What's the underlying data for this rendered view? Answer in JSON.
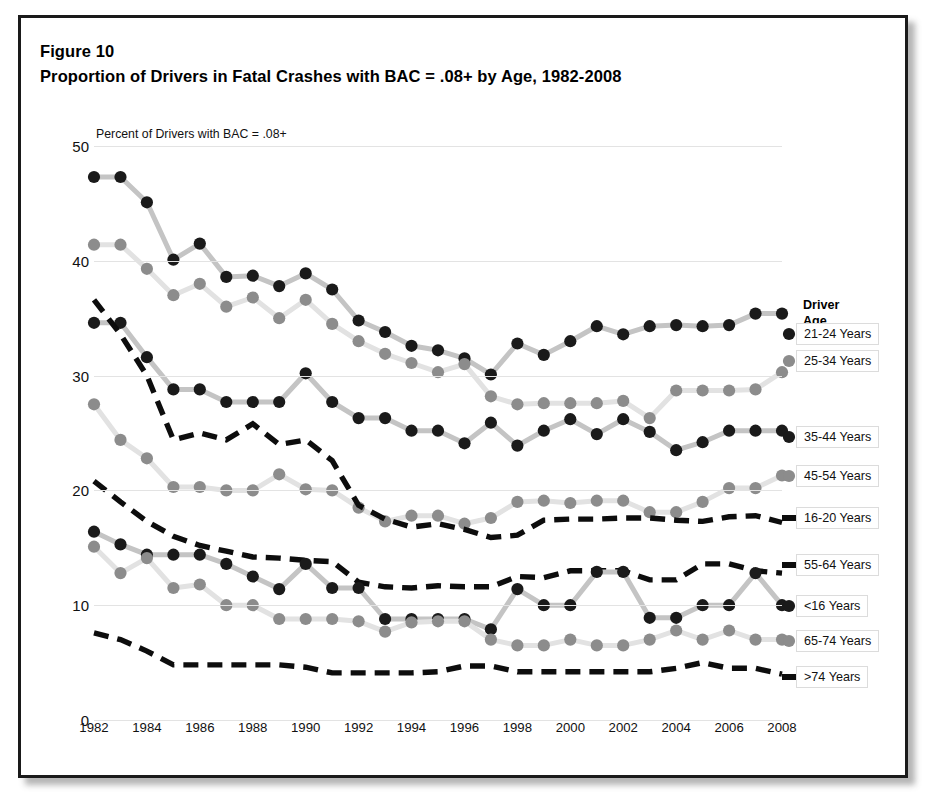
{
  "figure": {
    "number": "Figure 10",
    "title": "Proportion of Drivers in Fatal Crashes with BAC = .08+ by Age, 1982-2008",
    "axis_note": "Percent of Drivers with BAC = .08+"
  },
  "legend": {
    "title_line1": "Driver",
    "title_line2": "Age Group:",
    "items": [
      {
        "label": "21-24 Years",
        "marker": "black-circle",
        "color": "#1a1a1a",
        "y": 316
      },
      {
        "label": "25-34 Years",
        "marker": "gray-circle",
        "color": "#8c8c8c",
        "y": 343
      },
      {
        "label": "35-44 Years",
        "marker": "black-circle",
        "color": "#1a1a1a",
        "y": 419
      },
      {
        "label": "45-54 Years",
        "marker": "gray-circle",
        "color": "#8c8c8c",
        "y": 458
      },
      {
        "label": "16-20 Years",
        "marker": "black-dash",
        "color": "#0d0d0d",
        "y": 500
      },
      {
        "label": "55-64 Years",
        "marker": "black-dash",
        "color": "#0d0d0d",
        "y": 547
      },
      {
        "label": "<16 Years",
        "marker": "black-circle",
        "color": "#1a1a1a",
        "y": 588
      },
      {
        "label": "65-74 Years",
        "marker": "gray-circle",
        "color": "#8c8c8c",
        "y": 623
      },
      {
        "label": ">74 Years",
        "marker": "black-dash",
        "color": "#0d0d0d",
        "y": 659
      }
    ]
  },
  "chart_data": {
    "type": "line",
    "title": "Proportion of Drivers in Fatal Crashes with BAC = .08+ by Age, 1982-2008",
    "xlabel": "",
    "ylabel": "Percent of Drivers with BAC = .08+",
    "ylim": [
      0,
      50
    ],
    "yticks": [
      0,
      10,
      20,
      30,
      40,
      50
    ],
    "xlim": [
      1982,
      2008
    ],
    "xticks": [
      1982,
      1984,
      1986,
      1988,
      1990,
      1992,
      1994,
      1996,
      1998,
      2000,
      2002,
      2004,
      2006,
      2008
    ],
    "grid": true,
    "legend_position": "right",
    "x": [
      1982,
      1983,
      1984,
      1985,
      1986,
      1987,
      1988,
      1989,
      1990,
      1991,
      1992,
      1993,
      1994,
      1995,
      1996,
      1997,
      1998,
      1999,
      2000,
      2001,
      2002,
      2003,
      2004,
      2005,
      2006,
      2007,
      2008
    ],
    "series": [
      {
        "name": "21-24 Years",
        "style": "solid-black-circle",
        "color": "#1a1a1a",
        "values": [
          47.3,
          47.3,
          45.1,
          40.1,
          41.5,
          38.6,
          38.7,
          37.8,
          38.9,
          37.5,
          34.8,
          33.8,
          32.6,
          32.2,
          31.5,
          30.1,
          32.8,
          31.8,
          33.0,
          34.3,
          33.6,
          34.3,
          34.4,
          34.3,
          34.4,
          35.4,
          35.4
        ]
      },
      {
        "name": "25-34 Years",
        "style": "solid-gray-circle",
        "color": "#8c8c8c",
        "values": [
          41.4,
          41.4,
          39.3,
          37.0,
          38.0,
          36.0,
          36.8,
          35.0,
          36.6,
          34.5,
          33.0,
          31.9,
          31.1,
          30.3,
          31.0,
          28.2,
          27.5,
          27.6,
          27.6,
          27.6,
          27.8,
          26.3,
          28.7,
          28.7,
          28.7,
          28.8,
          30.3
        ]
      },
      {
        "name": "35-44 Years",
        "style": "solid-black-circle",
        "color": "#1a1a1a",
        "values": [
          34.6,
          34.6,
          31.6,
          28.8,
          28.8,
          27.7,
          27.7,
          27.7,
          30.2,
          27.7,
          26.3,
          26.3,
          25.2,
          25.2,
          24.1,
          25.9,
          23.9,
          25.2,
          26.2,
          24.9,
          26.2,
          25.1,
          23.5,
          24.2,
          25.2,
          25.2,
          25.2
        ]
      },
      {
        "name": "45-54 Years",
        "style": "solid-gray-circle",
        "color": "#8c8c8c",
        "values": [
          27.5,
          24.4,
          22.8,
          20.3,
          20.3,
          20.0,
          20.0,
          21.4,
          20.1,
          20.0,
          18.5,
          17.3,
          17.8,
          17.8,
          17.1,
          17.6,
          19.0,
          19.1,
          18.9,
          19.1,
          19.1,
          18.1,
          18.1,
          19.0,
          20.2,
          20.2,
          21.3
        ]
      },
      {
        "name": "16-20 Years",
        "style": "dashed-black",
        "color": "#0d0d0d",
        "values": [
          20.8,
          19.0,
          17.3,
          16.0,
          15.2,
          14.7,
          14.2,
          14.1,
          13.9,
          13.8,
          12.0,
          11.6,
          11.5,
          11.7,
          11.6,
          11.6,
          12.5,
          12.4,
          13.0,
          13.0,
          13.0,
          12.2,
          12.2,
          13.6,
          13.6,
          13.0,
          12.8
        ]
      },
      {
        "name": "55-64 Years",
        "style": "dashed-black",
        "color": "#0d0d0d",
        "values": [
          36.6,
          33.6,
          30.0,
          24.4,
          25.0,
          24.4,
          25.8,
          24.0,
          24.4,
          22.6,
          18.7,
          17.5,
          16.8,
          17.1,
          16.6,
          15.9,
          16.1,
          17.4,
          17.5,
          17.5,
          17.6,
          17.6,
          17.4,
          17.3,
          17.7,
          17.8,
          17.2
        ]
      },
      {
        "name": "<16 Years",
        "style": "solid-black-circle",
        "color": "#1a1a1a",
        "values": [
          16.4,
          15.3,
          14.4,
          14.4,
          14.4,
          13.6,
          12.5,
          11.4,
          13.6,
          11.5,
          11.5,
          8.8,
          8.8,
          8.8,
          8.8,
          7.9,
          11.4,
          10.0,
          10.0,
          12.9,
          12.9,
          8.9,
          8.9,
          10.0,
          10.0,
          12.8,
          10.0
        ]
      },
      {
        "name": "65-74 Years",
        "style": "solid-gray-circle",
        "color": "#8c8c8c",
        "values": [
          15.1,
          12.8,
          14.1,
          11.5,
          11.8,
          10.0,
          10.0,
          8.8,
          8.8,
          8.8,
          8.6,
          7.7,
          8.5,
          8.6,
          8.6,
          7.0,
          6.5,
          6.5,
          7.0,
          6.5,
          6.5,
          7.0,
          7.8,
          7.0,
          7.8,
          7.0,
          7.0
        ]
      },
      {
        "name": ">74 Years",
        "style": "dashed-black",
        "color": "#0d0d0d",
        "values": [
          7.6,
          7.0,
          6.0,
          4.8,
          4.8,
          4.8,
          4.8,
          4.8,
          4.6,
          4.1,
          4.1,
          4.1,
          4.1,
          4.2,
          4.7,
          4.7,
          4.2,
          4.2,
          4.2,
          4.2,
          4.2,
          4.2,
          4.5,
          5.0,
          4.5,
          4.5,
          4.0
        ]
      }
    ]
  }
}
